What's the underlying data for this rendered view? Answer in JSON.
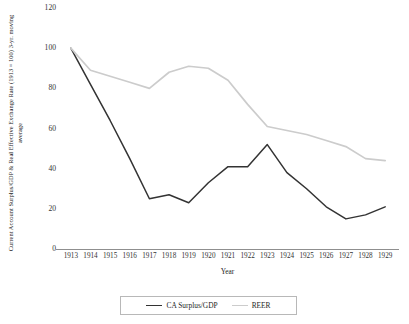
{
  "chart_data": {
    "type": "line",
    "title": "",
    "xlabel": "Year",
    "ylabel": "Current Account Surplus/GDP & Real Effective Exchange Rate (1913 = 100) 3-yr. moving average",
    "categories": [
      "1913",
      "1914",
      "1915",
      "1916",
      "1917",
      "1918",
      "1919",
      "1920",
      "1921",
      "1922",
      "1923",
      "1924",
      "1925",
      "1926",
      "1927",
      "1928",
      "1929"
    ],
    "ylim": [
      0,
      120
    ],
    "yticks": [
      0,
      20,
      40,
      60,
      80,
      100,
      120
    ],
    "grid": false,
    "legend_position": "bottom",
    "series": [
      {
        "name": "CA Surplus/GDP",
        "color": "#333333",
        "values": [
          100,
          82,
          64,
          45,
          25,
          27,
          23,
          33,
          41,
          41,
          52,
          38,
          30,
          21,
          15,
          17,
          21
        ]
      },
      {
        "name": "REER",
        "color": "#cccccc",
        "values": [
          100,
          89,
          86,
          83,
          80,
          88,
          91,
          90,
          84,
          72,
          61,
          59,
          57,
          54,
          51,
          45,
          44
        ]
      }
    ]
  },
  "axis": {
    "y_title": "Current Account Surplus/GDP & Real Effective Exchange Rate (1913 = 100) 3-yr. moving average",
    "x_title": "Year"
  }
}
